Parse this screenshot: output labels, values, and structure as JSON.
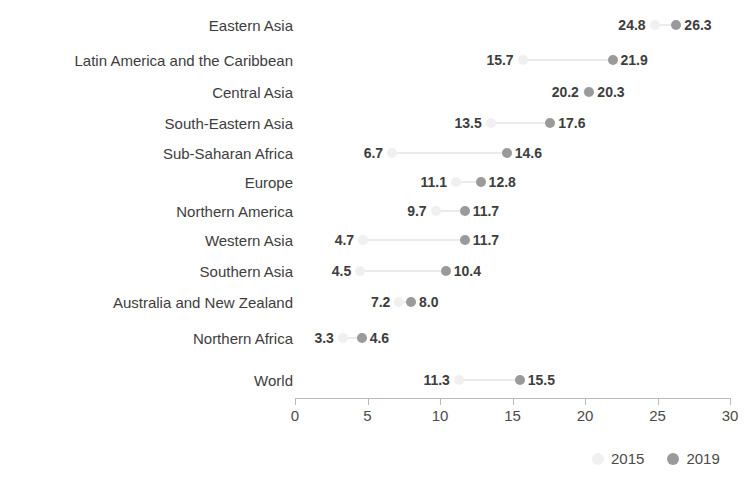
{
  "chart_data": {
    "type": "scatter",
    "subtype": "dumbbell",
    "title": "",
    "subtitle": "",
    "xlabel": "",
    "ylabel": "",
    "xlim": [
      0,
      30
    ],
    "xticks": [
      0,
      5,
      10,
      15,
      20,
      25,
      30
    ],
    "xtick_labels": [
      "0",
      "5",
      "10",
      "15",
      "20",
      "25",
      "30"
    ],
    "grid": false,
    "legend_position": "bottom-right",
    "legend": [
      "2015",
      "2019"
    ],
    "series": [
      {
        "name": "2015",
        "color": "#f0f0f0",
        "values": [
          24.8,
          15.7,
          20.2,
          13.5,
          6.7,
          11.1,
          9.7,
          4.7,
          4.5,
          7.2,
          3.3,
          11.3
        ]
      },
      {
        "name": "2019",
        "color": "#9a9a9a",
        "values": [
          26.3,
          21.9,
          20.3,
          17.6,
          14.6,
          12.8,
          11.7,
          11.7,
          10.4,
          8.0,
          4.6,
          15.5
        ]
      }
    ],
    "categories": [
      "Eastern Asia",
      "Latin America and the Caribbean",
      "Central Asia",
      "South-Eastern Asia",
      "Sub-Saharan Africa",
      "Europe",
      "Northern America",
      "Western Asia",
      "Southern Asia",
      "Australia and New Zealand",
      "Northern Africa",
      "World"
    ],
    "rows": [
      {
        "category": "Eastern Asia",
        "v2015": 24.8,
        "v2019": 26.3,
        "label_2015": "24.8",
        "label_2019": "26.3",
        "y": 25
      },
      {
        "category": "Latin America and the Caribbean",
        "v2015": 15.7,
        "v2019": 21.9,
        "label_2015": "15.7",
        "label_2019": "21.9",
        "y": 60
      },
      {
        "category": "Central Asia",
        "v2015": 20.2,
        "v2019": 20.3,
        "label_2015": "20.2",
        "label_2019": "20.3",
        "y": 92
      },
      {
        "category": "South-Eastern Asia",
        "v2015": 13.5,
        "v2019": 17.6,
        "label_2015": "13.5",
        "label_2019": "17.6",
        "y": 123
      },
      {
        "category": "Sub-Saharan Africa",
        "v2015": 6.7,
        "v2019": 14.6,
        "label_2015": "6.7",
        "label_2019": "14.6",
        "y": 153
      },
      {
        "category": "Europe",
        "v2015": 11.1,
        "v2019": 12.8,
        "label_2015": "11.1",
        "label_2019": "12.8",
        "y": 182
      },
      {
        "category": "Northern America",
        "v2015": 9.7,
        "v2019": 11.7,
        "label_2015": "9.7",
        "label_2019": "11.7",
        "y": 211
      },
      {
        "category": "Western Asia",
        "v2015": 4.7,
        "v2019": 11.7,
        "label_2015": "4.7",
        "label_2019": "11.7",
        "y": 240
      },
      {
        "category": "Southern Asia",
        "v2015": 4.5,
        "v2019": 10.4,
        "label_2015": "4.5",
        "label_2019": "10.4",
        "y": 271
      },
      {
        "category": "Australia and New Zealand",
        "v2015": 7.2,
        "v2019": 8.0,
        "label_2015": "7.2",
        "label_2019": "8.0",
        "y": 302
      },
      {
        "category": "Northern Africa",
        "v2015": 3.3,
        "v2019": 4.6,
        "label_2015": "3.3",
        "label_2019": "4.6",
        "y": 338
      },
      {
        "category": "World",
        "v2015": 11.3,
        "v2019": 15.5,
        "label_2015": "11.3",
        "label_2019": "15.5",
        "y": 380
      }
    ]
  },
  "legend": {
    "item_2015": "2015",
    "item_2019": "2019",
    "color_2015": "#f0f0f0",
    "color_2019": "#9a9a9a"
  },
  "axis": {
    "ticks": [
      "0",
      "5",
      "10",
      "15",
      "20",
      "25",
      "30"
    ]
  }
}
